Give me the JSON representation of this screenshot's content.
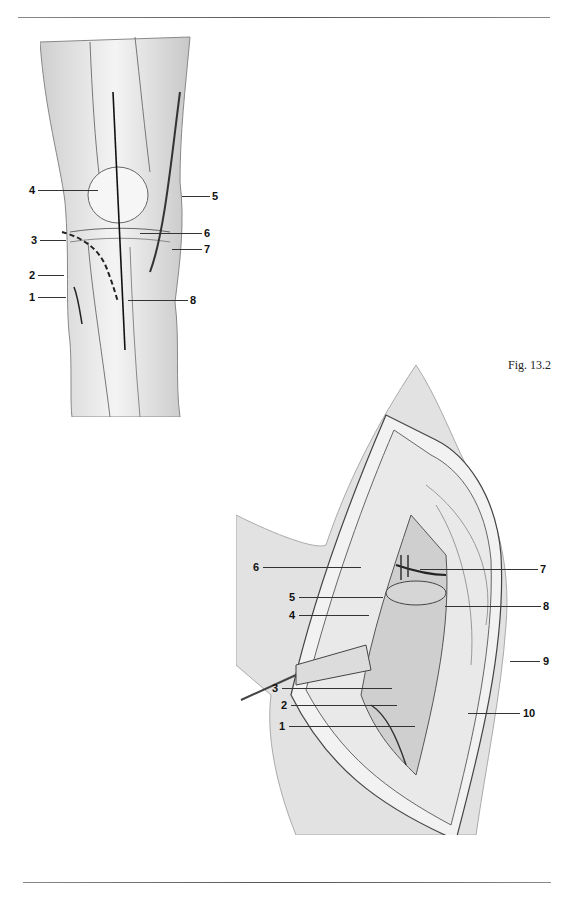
{
  "page": {
    "caption": "Fig. 13.2"
  },
  "figure_top": {
    "title": "Anterior view of knee with incision line",
    "labels": [
      {
        "n": "1",
        "side": "left",
        "x": 29,
        "y": 297
      },
      {
        "n": "2",
        "side": "left",
        "x": 29,
        "y": 275
      },
      {
        "n": "3",
        "side": "left",
        "x": 31,
        "y": 240
      },
      {
        "n": "4",
        "side": "left",
        "x": 29,
        "y": 190
      },
      {
        "n": "5",
        "side": "right",
        "x": 212,
        "y": 196
      },
      {
        "n": "6",
        "side": "right",
        "x": 204,
        "y": 233
      },
      {
        "n": "7",
        "side": "right",
        "x": 204,
        "y": 249
      },
      {
        "n": "8",
        "side": "right",
        "x": 190,
        "y": 300
      }
    ]
  },
  "figure_bottom": {
    "title": "Surgical exposure of knee joint",
    "labels": [
      {
        "n": "1",
        "side": "left",
        "x": 279,
        "y": 726
      },
      {
        "n": "2",
        "side": "left",
        "x": 281,
        "y": 705
      },
      {
        "n": "3",
        "side": "left",
        "x": 272,
        "y": 688
      },
      {
        "n": "4",
        "side": "left",
        "x": 289,
        "y": 615
      },
      {
        "n": "5",
        "side": "left",
        "x": 289,
        "y": 597
      },
      {
        "n": "6",
        "side": "left",
        "x": 253,
        "y": 567
      },
      {
        "n": "7",
        "side": "right",
        "x": 540,
        "y": 569
      },
      {
        "n": "8",
        "side": "right",
        "x": 543,
        "y": 606
      },
      {
        "n": "9",
        "side": "right",
        "x": 543,
        "y": 661
      },
      {
        "n": "10",
        "side": "right",
        "x": 523,
        "y": 713
      }
    ]
  }
}
